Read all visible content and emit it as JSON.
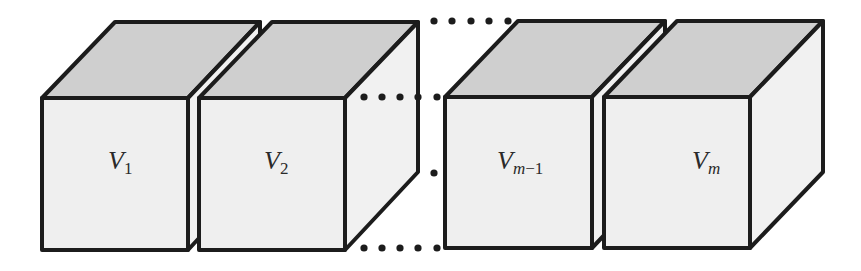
{
  "diagram": {
    "colors": {
      "stroke": "#1c1c1c",
      "front_face": "#efefef",
      "side_face": "#f1f1f1",
      "top_face": "#cfcfcf",
      "dots": "#1c1c1c"
    },
    "cubes": [
      {
        "id": "v1",
        "label_main": "V",
        "label_sub": "1",
        "label_sub_italic": false
      },
      {
        "id": "v2",
        "label_main": "V",
        "label_sub": "2",
        "label_sub_italic": false
      },
      {
        "id": "vm-1",
        "label_main": "V",
        "label_sub_m": "m",
        "label_sub_rest": "−1"
      },
      {
        "id": "vm",
        "label_main": "V",
        "label_sub": "m",
        "label_sub_italic": true
      }
    ],
    "ellipsis": "continuation dots between V2 and Vm-1"
  }
}
